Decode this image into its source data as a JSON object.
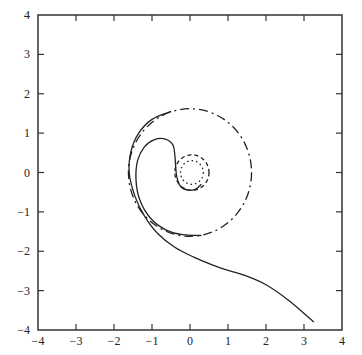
{
  "chart_data": {
    "type": "line",
    "title": "",
    "xlabel": "",
    "ylabel": "",
    "xlim": [
      -4,
      4
    ],
    "ylim": [
      -4,
      4
    ],
    "grid": false,
    "legend": null,
    "aspect": "equal",
    "x_ticks": [
      -4,
      -3,
      -2,
      -1,
      0,
      1,
      2,
      3,
      4
    ],
    "y_ticks": [
      -4,
      -3,
      -2,
      -1,
      0,
      1,
      2,
      3,
      4
    ],
    "x_tick_labels": [
      "−4",
      "−3",
      "−2",
      "−1",
      "0",
      "1",
      "2",
      "3",
      "4"
    ],
    "y_tick_labels": [
      "−4",
      "−3",
      "−2",
      "−1",
      "0",
      "1",
      "2",
      "3",
      "4"
    ],
    "series": [
      {
        "name": "outer-trajectory",
        "style": "solid",
        "points": [
          [
            3.26,
            -3.8
          ],
          [
            2.6,
            -3.25
          ],
          [
            2.0,
            -2.85
          ],
          [
            1.4,
            -2.6
          ],
          [
            1.05,
            -2.5
          ],
          [
            0.6,
            -2.35
          ],
          [
            0.1,
            -2.15
          ],
          [
            -0.4,
            -1.9
          ],
          [
            -0.85,
            -1.55
          ],
          [
            -1.2,
            -1.1
          ],
          [
            -1.45,
            -0.6
          ],
          [
            -1.6,
            0.0
          ],
          [
            -1.55,
            0.55
          ],
          [
            -1.35,
            1.0
          ],
          [
            -1.0,
            1.35
          ],
          [
            -0.5,
            1.55
          ]
        ]
      },
      {
        "name": "large-limit-cycle",
        "style": "dashdot",
        "circle": {
          "cx": 0,
          "cy": 0,
          "r": 1.62
        }
      },
      {
        "name": "inner-trajectory",
        "style": "solid",
        "points": [
          [
            0.3,
            -1.6
          ],
          [
            -0.2,
            -1.58
          ],
          [
            -0.65,
            -1.45
          ],
          [
            -1.05,
            -1.15
          ],
          [
            -1.32,
            -0.7
          ],
          [
            -1.42,
            -0.2
          ],
          [
            -1.38,
            0.3
          ],
          [
            -1.2,
            0.65
          ],
          [
            -0.95,
            0.83
          ],
          [
            -0.65,
            0.85
          ],
          [
            -0.45,
            0.7
          ],
          [
            -0.4,
            0.45
          ],
          [
            -0.38,
            0.2
          ],
          [
            -0.35,
            -0.1
          ],
          [
            -0.25,
            -0.35
          ],
          [
            -0.05,
            -0.45
          ],
          [
            0.15,
            -0.42
          ],
          [
            0.3,
            -0.3
          ]
        ]
      },
      {
        "name": "small-cycle-outer",
        "style": "dashed",
        "circle": {
          "cx": 0.05,
          "cy": 0.0,
          "r": 0.45
        }
      },
      {
        "name": "small-cycle-inner",
        "style": "dotted",
        "circle": {
          "cx": 0.05,
          "cy": 0.0,
          "r": 0.3
        }
      }
    ]
  },
  "colors": {
    "axis": "#333333",
    "line": "#222222",
    "background": "#ffffff"
  }
}
